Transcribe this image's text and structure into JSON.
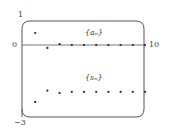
{
  "chart_data": {
    "type": "scatter",
    "title": "",
    "xlabel": "",
    "ylabel": "",
    "xlim": [
      0,
      10
    ],
    "ylim": [
      -3,
      1
    ],
    "x_ticks": [
      "0",
      "10"
    ],
    "y_ticks": [
      "1",
      "0",
      "-3"
    ],
    "grid": false,
    "series": [
      {
        "name": "{a_n}",
        "label": "{aₙ}",
        "x": [
          1,
          2,
          3,
          4,
          5,
          6,
          7,
          8,
          9,
          10
        ],
        "values": [
          0.5,
          -0.12,
          0.04,
          0.0,
          0.0,
          0.0,
          0.0,
          0.0,
          0.0,
          0.0
        ]
      },
      {
        "name": "{s_n}",
        "label": "{sₙ}",
        "x": [
          1,
          2,
          3,
          4,
          5,
          6,
          7,
          8,
          9,
          10
        ],
        "values": [
          -2.37,
          -1.9,
          -2.0,
          -1.95,
          -1.95,
          -1.95,
          -1.95,
          -1.95,
          -1.95,
          -1.95
        ]
      }
    ]
  },
  "axis": {
    "y_top": "1",
    "y_zero": "0",
    "y_bottom": "−3",
    "x_right": "10"
  },
  "legend": {
    "a": "{aₙ}",
    "s": "{sₙ}"
  }
}
